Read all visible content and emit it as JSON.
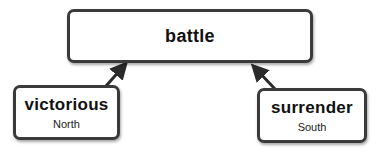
{
  "diagram": {
    "root": {
      "label": "battle"
    },
    "children": [
      {
        "label": "victorious",
        "sublabel": "North"
      },
      {
        "label": "surrender",
        "sublabel": "South"
      }
    ],
    "colors": {
      "border": "#3a3a3a",
      "text": "#111111",
      "background": "#ffffff"
    }
  }
}
